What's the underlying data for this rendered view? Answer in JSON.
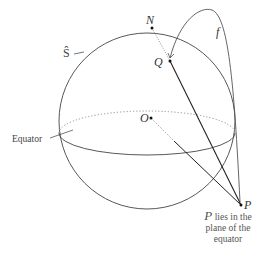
{
  "diagram": {
    "labels": {
      "sphere": "Ŝ",
      "north_pole": "N",
      "point_q": "Q",
      "center": "O",
      "point_p": "P",
      "map": "f",
      "equator": "Equator"
    },
    "note": {
      "symbol": "P",
      "line1": "lies in the",
      "line2": "plane of the",
      "line3": "equator"
    },
    "colors": {
      "stroke": "#333333",
      "dotted": "#777777",
      "text": "#444444"
    }
  }
}
